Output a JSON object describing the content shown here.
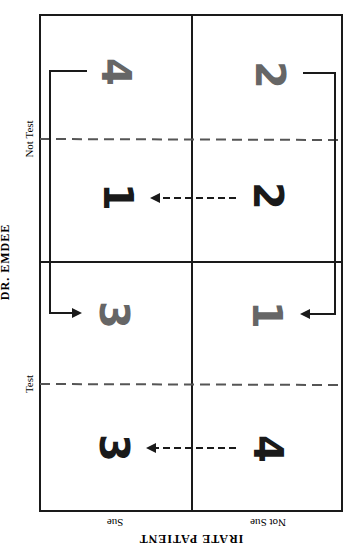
{
  "diagram": {
    "row_player": "DR. EMDEE",
    "column_player": "IRATE PATIENT",
    "row_strategies": [
      "Not Test",
      "Test"
    ],
    "column_strategies": [
      "Sue",
      "Not Sue"
    ],
    "orientation_note": "image rotated 90 degrees counter-clockwise",
    "colors": {
      "line": "#1a1a1a",
      "dashed": "#555555",
      "gray_number": "#666666",
      "black_number": "#1a1a1a"
    }
  },
  "cells": {
    "top_left_upper": "4",
    "top_left_lower": "1",
    "top_right_upper": "2",
    "top_right_lower": "2",
    "bottom_left_upper": "3",
    "bottom_left_lower": "3",
    "bottom_right_upper": "1",
    "bottom_right_lower": "4"
  },
  "labels": {
    "not_test": "Not Test",
    "test": "Test",
    "dr_emdee": "DR. EMDEE",
    "sue": "Sue",
    "not_sue": "Not Sue",
    "irate_patient": "IRATE PATIENT"
  }
}
